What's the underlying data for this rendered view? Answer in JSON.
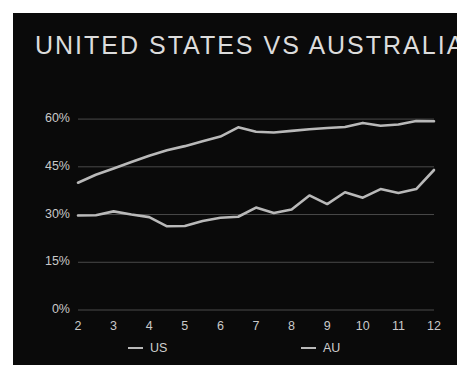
{
  "chart_data": {
    "type": "line",
    "title": "UNITED STATES VS AUSTRALIA",
    "xlabel": "",
    "ylabel": "",
    "x": [
      2,
      2.5,
      3,
      3.5,
      4,
      4.5,
      5,
      5.5,
      6,
      6.5,
      7,
      7.5,
      8,
      8.5,
      9,
      9.5,
      10,
      10.5,
      11,
      11.5,
      12
    ],
    "xtick_labels": [
      "2",
      "3",
      "4",
      "5",
      "6",
      "7",
      "8",
      "9",
      "10",
      "11",
      "12"
    ],
    "xticks": [
      2,
      3,
      4,
      5,
      6,
      7,
      8,
      9,
      10,
      11,
      12
    ],
    "ytick_labels": [
      "60%",
      "45%",
      "30%",
      "15%",
      "0%"
    ],
    "yticks": [
      60,
      45,
      30,
      15,
      0
    ],
    "ylim": [
      0,
      66
    ],
    "xlim": [
      2,
      12
    ],
    "grid": true,
    "legend_position": "bottom",
    "series": [
      {
        "name": "US",
        "color": "#b9b9b9",
        "values": [
          40.0,
          42.5,
          44.5,
          46.5,
          48.5,
          50.2,
          51.5,
          53.0,
          54.5,
          57.4,
          56.0,
          55.8,
          56.3,
          56.8,
          57.2,
          57.5,
          58.8,
          57.9,
          58.3,
          59.4,
          59.3
        ]
      },
      {
        "name": "AU",
        "color": "#b9b9b9",
        "values": [
          29.7,
          29.8,
          31.0,
          30.0,
          29.2,
          26.3,
          26.4,
          28.0,
          29.0,
          29.3,
          32.2,
          30.5,
          31.6,
          36.0,
          33.3,
          37.0,
          35.3,
          38.0,
          36.8,
          38.0,
          44.0
        ]
      }
    ]
  },
  "legend": {
    "items": [
      {
        "label": "US"
      },
      {
        "label": "AU"
      }
    ]
  },
  "colors": {
    "panel_background": "#0a0a0a",
    "page_background": "#ffffff",
    "line": "#b9b9b9",
    "grid": "#4a4a4a",
    "text": "#c9c9c9",
    "title_text": "#dcdcdc"
  }
}
